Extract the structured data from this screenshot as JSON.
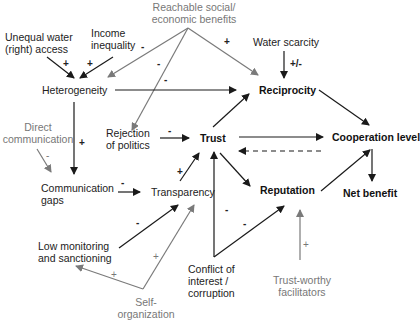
{
  "nodes": {
    "unequal_water": "Unequal water\n(right) access",
    "unequal_water_l1": "Unequal water",
    "unequal_water_l2": "(right) access",
    "income_l1": "Income",
    "income_l2": "inequality",
    "reachable_l1": "Reachable social/",
    "reachable_l2": "economic benefits",
    "water_scarcity": "Water scarcity",
    "heterogeneity": "Heterogeneity",
    "reciprocity": "Reciprocity",
    "direct_l1": "Direct",
    "direct_l2": "communication",
    "rejection_l1": "Rejection",
    "rejection_l2": "of politics",
    "trust": "Trust",
    "cooperation": "Cooperation level",
    "comm_gaps_l1": "Communication",
    "comm_gaps_l2": "gaps",
    "transparency": "Transparency",
    "reputation": "Reputation",
    "net_benefit": "Net benefit",
    "low_mon_l1": "Low monitoring",
    "low_mon_l2": "and sanctioning",
    "conflict_l1": "Conflict of",
    "conflict_l2": "interest /",
    "conflict_l3": "corruption",
    "self_org_l1": "Self-",
    "self_org_l2": "organization",
    "facilitators_l1": "Trust-worthy",
    "facilitators_l2": "facilitators"
  },
  "signs": {
    "unequal_to_het": "+",
    "income_to_het": "+",
    "reach_to_het": "-",
    "reach_to_rejection": "-",
    "reach_to_reciprocity_via_het": "-",
    "reach_to_reciprocity": "+",
    "water_to_reciprocity": "+/-",
    "het_to_comm_gaps": "+",
    "direct_to_comm_gaps": "-",
    "rejection_to_trust": "-",
    "comm_gaps_to_transparency": "-",
    "transparency_to_trust": "+",
    "low_mon_to_transparency": "-",
    "self_org_to_low_mon": "+",
    "self_org_to_transparency": "+",
    "conflict_to_trust": "-",
    "conflict_to_reputation": "-",
    "facilitators_to_reputation": "+"
  },
  "colors": {
    "black_edge": "#1a1a1a",
    "gray_edge": "#7a7a7a",
    "gray_text": "#777777"
  }
}
